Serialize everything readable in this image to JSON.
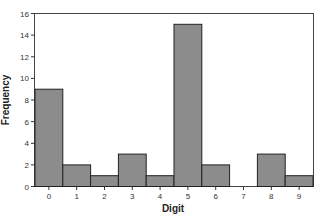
{
  "chart_data": {
    "type": "bar",
    "title": "",
    "xlabel": "Digit",
    "ylabel": "Frequency",
    "categories": [
      "0",
      "1",
      "2",
      "3",
      "4",
      "5",
      "6",
      "7",
      "8",
      "9"
    ],
    "values": [
      9,
      2,
      1,
      3,
      1,
      15,
      2,
      0,
      3,
      1
    ],
    "ylim": [
      0,
      16
    ],
    "yticks": [
      0,
      2,
      4,
      6,
      8,
      10,
      12,
      14,
      16
    ],
    "grid": false,
    "legend": null,
    "colors": {
      "bar_fill": "#8c8c8c",
      "bar_stroke": "#222222",
      "axis": "#333333",
      "background": "#ffffff"
    }
  }
}
